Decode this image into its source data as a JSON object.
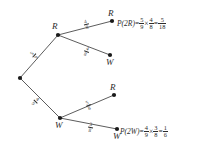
{
  "diagram": {
    "type": "probability-tree",
    "stage_count": 2,
    "colors": {
      "line": "#4a4a4a",
      "node": "#1a1a1a",
      "text": "#2b2b2b",
      "background": "#ffffff"
    }
  },
  "nodes": {
    "root": {
      "label": "",
      "x": 20,
      "y": 78
    },
    "first_red": {
      "label": "R",
      "x": 58,
      "y": 35
    },
    "first_white": {
      "label": "W",
      "x": 60,
      "y": 118
    },
    "rr": {
      "label": "R",
      "x": 112,
      "y": 21
    },
    "rw": {
      "label": "W",
      "x": 110,
      "y": 55
    },
    "wr": {
      "label": "R",
      "x": 114,
      "y": 95
    },
    "ww": {
      "label": "W",
      "x": 117,
      "y": 129
    }
  },
  "branches": [
    {
      "name": "root-to-red",
      "from": "root",
      "to": "first_red",
      "numerator": "5",
      "denominator": "9"
    },
    {
      "name": "root-to-white",
      "from": "root",
      "to": "first_white",
      "numerator": "4",
      "denominator": "9"
    },
    {
      "name": "red-to-red",
      "from": "first_red",
      "to": "rr",
      "numerator": "4",
      "denominator": "8"
    },
    {
      "name": "red-to-white",
      "from": "first_red",
      "to": "rw",
      "numerator": "4",
      "denominator": "8"
    },
    {
      "name": "white-to-red",
      "from": "first_white",
      "to": "wr",
      "numerator": "5",
      "denominator": "8"
    },
    {
      "name": "white-to-white",
      "from": "first_white",
      "to": "ww",
      "numerator": "3",
      "denominator": "8"
    }
  ],
  "equations": {
    "p2r": {
      "label": "P(2R)",
      "equals": "=",
      "times": "×",
      "factor1": {
        "numerator": "5",
        "denominator": "9"
      },
      "factor2": {
        "numerator": "4",
        "denominator": "8"
      },
      "result": {
        "numerator": "5",
        "denominator": "18"
      }
    },
    "p2w": {
      "label": "P(2W)",
      "equals": "=",
      "times": "×",
      "factor1": {
        "numerator": "4",
        "denominator": "9"
      },
      "factor2": {
        "numerator": "3",
        "denominator": "8"
      },
      "result": {
        "numerator": "1",
        "denominator": "6"
      }
    }
  }
}
